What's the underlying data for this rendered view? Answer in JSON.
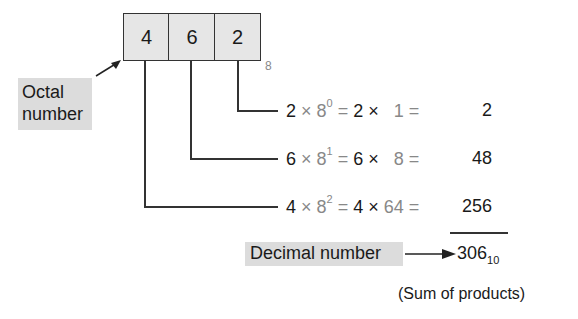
{
  "octal_number": {
    "digits": [
      "4",
      "6",
      "2"
    ],
    "base_subscript": "8",
    "label_line1": "Octal",
    "label_line2": "number"
  },
  "equations": [
    {
      "digit": "2",
      "times": "×",
      "base": "8",
      "exponent": "0",
      "equals1": "=",
      "digit_repeat": "2",
      "times2": "×",
      "power_value": "1",
      "equals2": "=",
      "product": "2"
    },
    {
      "digit": "6",
      "times": "×",
      "base": "8",
      "exponent": "1",
      "equals1": "=",
      "digit_repeat": "6",
      "times2": "×",
      "power_value": "8",
      "equals2": "=",
      "product": "48"
    },
    {
      "digit": "4",
      "times": "×",
      "base": "8",
      "exponent": "2",
      "equals1": "=",
      "digit_repeat": "4",
      "times2": "×",
      "power_value": "64",
      "equals2": "=",
      "product": "256"
    }
  ],
  "result": {
    "label": "Decimal number",
    "value": "306",
    "base_subscript": "10",
    "note": "(Sum of products)"
  },
  "colors": {
    "box_fill": "#e6e6e6",
    "label_fill": "#dcdcdc",
    "gray_text": "#888888",
    "ink": "#1a1a1a"
  }
}
